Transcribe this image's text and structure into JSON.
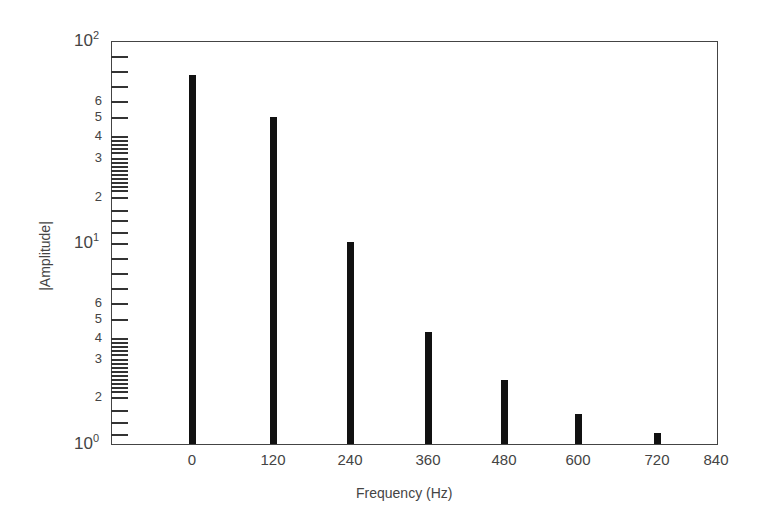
{
  "chart_data": {
    "type": "bar",
    "title": "",
    "xlabel": "Frequency (Hz)",
    "ylabel": "|Amplitude|",
    "yscale": "log",
    "ylim": [
      1,
      100
    ],
    "xlim": [
      -120,
      840
    ],
    "grid": false,
    "legend": null,
    "x_ticks": [
      "0",
      "120",
      "240",
      "360",
      "480",
      "600",
      "720",
      "840"
    ],
    "y_major_ticks": [
      {
        "base": "10",
        "exp": "0",
        "value": 1
      },
      {
        "base": "10",
        "exp": "1",
        "value": 10
      },
      {
        "base": "10",
        "exp": "2",
        "value": 100
      }
    ],
    "y_minor_tick_labels": [
      "2",
      "3",
      "4",
      "5",
      "6"
    ],
    "categories": [
      "0",
      "120",
      "240",
      "360",
      "480",
      "600",
      "720"
    ],
    "x": [
      0,
      120,
      240,
      360,
      480,
      600,
      720
    ],
    "values": [
      80,
      50,
      10,
      4.3,
      2.4,
      1.5,
      1.2
    ],
    "bar_color": "#111111"
  },
  "layout": {
    "plot": {
      "left": 111,
      "top": 41,
      "right": 717,
      "bottom": 444
    },
    "x_pixel": {
      "0": 192,
      "120": 273,
      "240": 350,
      "360": 428,
      "480": 504,
      "600": 578,
      "720": 657,
      "840": 716
    },
    "bar_tops": [
      75,
      117,
      242,
      332,
      380,
      414,
      433
    ],
    "bar_width": 7,
    "y_ticks_px": [
      56,
      71,
      86,
      101,
      117,
      136,
      140,
      144,
      148,
      152,
      158,
      162,
      166,
      170,
      174,
      178,
      182,
      186,
      190,
      197,
      210,
      220,
      232,
      258,
      273,
      288,
      303,
      319,
      338,
      342,
      346,
      350,
      354,
      359,
      363,
      367,
      371,
      375,
      379,
      383,
      387,
      391,
      397,
      410,
      422,
      434
    ],
    "y_minor_labels_px": {
      "upper": {
        "6": 101,
        "5": 117,
        "4": 136,
        "3": 158,
        "2": 197
      },
      "lower": {
        "6": 303,
        "5": 319,
        "4": 338,
        "3": 359,
        "2": 397
      }
    },
    "y_major_px": {
      "0": 444,
      "1": 243,
      "2": 41
    }
  }
}
